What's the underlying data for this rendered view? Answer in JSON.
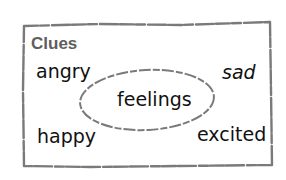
{
  "diagram": {
    "title": "Clues",
    "center": "feelings",
    "clues": [
      {
        "label": "angry",
        "position": "top-left"
      },
      {
        "label": "sad",
        "position": "top-right"
      },
      {
        "label": "happy",
        "position": "bottom-left"
      },
      {
        "label": "excited",
        "position": "bottom-right"
      }
    ],
    "colors": {
      "border": "#7a7a7a",
      "title": "#5e5e5e",
      "text": "#111111"
    }
  }
}
